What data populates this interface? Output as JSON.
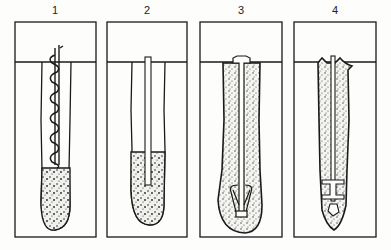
{
  "diagram": {
    "title": "",
    "panels": [
      {
        "label": "1",
        "tool": "auger-icon",
        "fill_level": "lower"
      },
      {
        "label": "2",
        "tool": "rod-icon",
        "fill_level": "lower"
      },
      {
        "label": "3",
        "tool": "expanding-anchor-icon",
        "fill_level": "full"
      },
      {
        "label": "4",
        "tool": "rod-with-plate-icon",
        "fill_level": "full"
      }
    ]
  },
  "colors": {
    "ink": "#1a1a1a",
    "background": "#fdfdfb",
    "fill_dots": "#333333"
  }
}
